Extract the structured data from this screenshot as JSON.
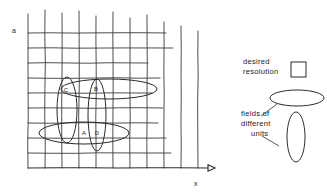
{
  "figure": {
    "background_color": "#ffffff",
    "ink_color": "#2b2b2b",
    "grid_color": "#3a3a3a"
  },
  "axes": {
    "y_label": "a",
    "x_label": "x",
    "x_axis_arrow": "arrow-right"
  },
  "grid": {
    "columns": 10,
    "rows": 9,
    "origin_x": 28,
    "origin_y": 168,
    "cell_width": 17,
    "cell_height": 15,
    "v_line_tops": [
      14,
      10,
      13,
      11,
      16,
      12,
      18,
      15,
      22,
      26,
      31
    ],
    "h_line_rights": [
      171,
      166,
      158,
      163,
      152,
      160,
      148,
      173,
      166,
      151
    ]
  },
  "fields": [
    {
      "id": "field-a",
      "label": "A",
      "label_x": 84,
      "label_y": 135,
      "cx": 84,
      "cy": 133,
      "rx": 45,
      "ry": 11,
      "rotation": 0,
      "orientation": "horizontal"
    },
    {
      "id": "field-b",
      "label": "B",
      "label_x": 96,
      "label_y": 91,
      "cx": 109,
      "cy": 89,
      "rx": 48,
      "ry": 10,
      "rotation": 0,
      "orientation": "horizontal"
    },
    {
      "id": "field-c",
      "label": "C",
      "label_x": 66,
      "label_y": 92,
      "cx": 67,
      "cy": 110,
      "rx": 10,
      "ry": 33,
      "rotation": 0,
      "orientation": "vertical"
    },
    {
      "id": "field-d",
      "label": "D",
      "label_x": 97,
      "label_y": 135,
      "cx": 97,
      "cy": 115,
      "rx": 9,
      "ry": 36,
      "rotation": 0,
      "orientation": "vertical"
    }
  ],
  "legend": {
    "desired_resolution": {
      "line1": "desired",
      "line2": "resolution",
      "shape": "square",
      "square_x": 291,
      "square_y": 62,
      "square_size": 15
    },
    "fields_of_different_units": {
      "line1": "fields of",
      "line2": "different",
      "line3": "units",
      "shapes": [
        {
          "id": "legend-ellipse-horizontal",
          "cx": 297,
          "cy": 98,
          "rx": 27,
          "ry": 8,
          "orientation": "horizontal"
        },
        {
          "id": "legend-ellipse-vertical",
          "cx": 296,
          "cy": 137,
          "rx": 9,
          "ry": 25,
          "orientation": "vertical"
        }
      ],
      "leaders": [
        {
          "id": "leader-to-horizontal-ellipse",
          "x1": 261,
          "y1": 116,
          "x2": 277,
          "y2": 104
        },
        {
          "id": "leader-to-vertical-ellipse",
          "x1": 262,
          "y1": 136,
          "x2": 279,
          "y2": 146
        }
      ]
    }
  }
}
